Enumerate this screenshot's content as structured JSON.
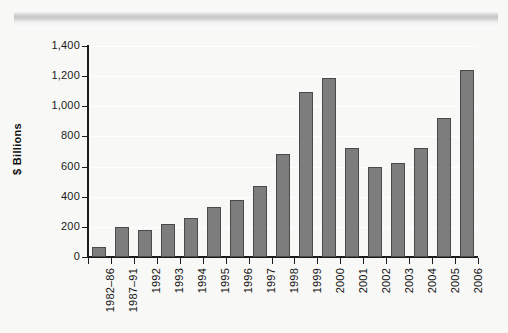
{
  "chart_data": {
    "type": "bar",
    "title": "",
    "xlabel": "",
    "ylabel": "$ Billions",
    "ylim": [
      0,
      1400
    ],
    "ytick_values": [
      0,
      200,
      400,
      600,
      800,
      1000,
      1200,
      1400
    ],
    "ytick_labels": [
      "0",
      "200",
      "400",
      "600",
      "800",
      "1,000",
      "1,200",
      "1,400"
    ],
    "grid": true,
    "legend": "none",
    "categories": [
      "1982–86",
      "1987–91",
      "1992",
      "1993",
      "1994",
      "1995",
      "1996",
      "1997",
      "1998",
      "1999",
      "2000",
      "2001",
      "2002",
      "2003",
      "2004",
      "2005",
      "2006"
    ],
    "values": [
      65,
      197,
      177,
      222,
      258,
      332,
      378,
      473,
      685,
      1095,
      1188,
      725,
      600,
      622,
      720,
      922,
      1240
    ],
    "bar_color": "#7d7d7d",
    "bar_edge_color": "#4a4a4a",
    "background_color": "#f8f8f6",
    "axis_color": "#1b1b1b",
    "gridline_color": "#ffffff"
  }
}
